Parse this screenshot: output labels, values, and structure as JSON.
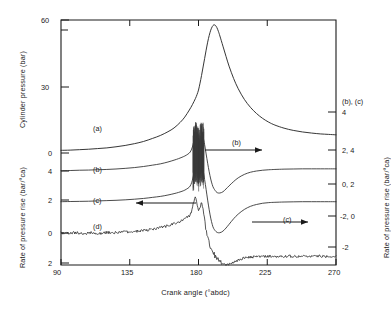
{
  "chart_data": {
    "type": "line",
    "title": "",
    "xlabel": "Crank angle (°abdc)",
    "ylabel_left_top": "Cylinder pressure (bar)",
    "ylabel_left_bottom": "Rate of pressure rise (bar/°ca)",
    "ylabel_right": "Rate of pressure rise (bar/°ca)",
    "right_axis_header": "(b), (c)",
    "xlim": [
      90,
      270
    ],
    "xticks": [
      90,
      135,
      180,
      225,
      270
    ],
    "xticklabels": [
      "90",
      "135",
      "180",
      "225",
      "270"
    ],
    "left_axis_upper_ticklabels": [
      "60",
      "30",
      "0"
    ],
    "left_axis_lower_ticklabels": [
      "4",
      "2",
      "0",
      "2"
    ],
    "right_axis_ticklabels": [
      "4",
      "2,  4",
      "0,  2",
      "-2,  0",
      "-2"
    ],
    "grid": false,
    "legend_position": "inline-annotations",
    "annotations": [
      {
        "text": "(a)",
        "x": 124,
        "y": 0
      },
      {
        "text": "(b)",
        "x": 110,
        "y": 0
      },
      {
        "text": "(c)",
        "x": 110,
        "y": 0
      },
      {
        "text": "(d)",
        "x": 112,
        "y": 0
      },
      {
        "text": "(b)",
        "x": 196,
        "y": 0
      },
      {
        "text": "(c)",
        "x": 223,
        "y": 0
      }
    ],
    "arrows": [
      {
        "name": "arrow-b-right",
        "direction": "right"
      },
      {
        "name": "arrow-c-right",
        "direction": "right"
      },
      {
        "name": "arrow-d-left",
        "direction": "left"
      }
    ],
    "series": [
      {
        "name": "(a)",
        "label": "(a)",
        "axis": "left-upper",
        "description": "Cylinder pressure trace, rises to peak near 190 deg abdc",
        "x": [
          90,
          96,
          102,
          108,
          114,
          120,
          126,
          132,
          138,
          144,
          150,
          155,
          160,
          164,
          168,
          171,
          174,
          176,
          178,
          179,
          180,
          181,
          182,
          183,
          184,
          185,
          186,
          187,
          188,
          189,
          190,
          191,
          192,
          193,
          194,
          196,
          198,
          200,
          203,
          206,
          210,
          214,
          218,
          222,
          226,
          230,
          236,
          242,
          248,
          254,
          260,
          265,
          270
        ],
        "y": [
          1.2,
          1.3,
          1.5,
          1.7,
          2.0,
          2.3,
          2.8,
          3.4,
          4.2,
          5.2,
          6.6,
          7.9,
          9.6,
          11.3,
          13.8,
          16.2,
          19.4,
          21.8,
          24.6,
          26.3,
          28.4,
          31.5,
          35.0,
          38.8,
          42.6,
          46.4,
          50.0,
          53.0,
          55.4,
          57.0,
          57.8,
          57.6,
          56.6,
          54.9,
          52.8,
          48.2,
          43.6,
          39.2,
          33.6,
          29.0,
          24.2,
          20.6,
          17.8,
          15.6,
          13.9,
          12.6,
          11.2,
          10.2,
          9.5,
          9.0,
          8.6,
          8.4,
          8.2
        ]
      },
      {
        "name": "(b)",
        "label": "(b)",
        "axis": "right",
        "description": "Rate of pressure rise trace b, offset baseline near 4 on left-lower scale, sharp spike at 180 deg",
        "x": [
          90,
          96,
          102,
          108,
          114,
          120,
          126,
          132,
          138,
          144,
          150,
          155,
          160,
          164,
          167,
          170,
          172,
          174,
          175,
          176,
          177,
          178,
          179,
          180,
          181,
          182,
          183,
          184,
          185,
          186,
          187,
          188,
          189,
          190,
          192,
          194,
          196,
          198,
          200,
          203,
          206,
          210,
          214,
          218,
          222,
          226,
          230,
          236,
          242,
          248,
          254,
          260,
          265,
          270
        ],
        "y": [
          4.02,
          4.03,
          4.05,
          4.06,
          4.08,
          4.1,
          4.13,
          4.17,
          4.22,
          4.29,
          4.38,
          4.46,
          4.58,
          4.7,
          4.8,
          4.92,
          5.02,
          5.16,
          5.3,
          5.55,
          5.92,
          6.25,
          6.05,
          5.72,
          5.95,
          6.35,
          6.18,
          5.7,
          5.1,
          4.5,
          3.95,
          3.48,
          3.12,
          2.88,
          2.62,
          2.58,
          2.66,
          2.84,
          3.04,
          3.32,
          3.56,
          3.78,
          3.92,
          4.0,
          4.05,
          4.08,
          4.1,
          4.12,
          4.13,
          4.14,
          4.14,
          4.14,
          4.14,
          4.14
        ]
      },
      {
        "name": "(c)",
        "label": "(c)",
        "axis": "right",
        "description": "Rate of pressure rise trace c, offset baseline near 2 on left-lower scale, sharp spike at 180 deg",
        "x": [
          90,
          96,
          102,
          108,
          114,
          120,
          126,
          132,
          138,
          144,
          150,
          155,
          160,
          164,
          167,
          170,
          172,
          174,
          175,
          176,
          177,
          178,
          179,
          180,
          181,
          182,
          183,
          184,
          185,
          186,
          187,
          188,
          189,
          190,
          192,
          194,
          196,
          198,
          200,
          203,
          206,
          210,
          214,
          218,
          222,
          226,
          230,
          236,
          242,
          248,
          254,
          260,
          265,
          270
        ],
        "y": [
          2.02,
          2.03,
          2.04,
          2.05,
          2.07,
          2.09,
          2.11,
          2.14,
          2.18,
          2.23,
          2.3,
          2.36,
          2.45,
          2.54,
          2.62,
          2.72,
          2.82,
          2.96,
          3.12,
          3.4,
          3.86,
          4.3,
          4.05,
          3.62,
          3.88,
          4.3,
          4.05,
          3.45,
          2.8,
          2.12,
          1.5,
          0.96,
          0.55,
          0.28,
          0.05,
          0.02,
          0.12,
          0.32,
          0.56,
          0.92,
          1.22,
          1.52,
          1.72,
          1.84,
          1.92,
          1.96,
          1.98,
          2.0,
          2.01,
          2.02,
          2.02,
          2.02,
          2.02,
          2.02
        ]
      },
      {
        "name": "(d)",
        "label": "(d)",
        "axis": "left-lower",
        "description": "Noisy rate of pressure rise trace d, baseline near 0, large spike then deep trough near 200 deg",
        "x": [
          90,
          95,
          100,
          105,
          110,
          115,
          120,
          125,
          130,
          135,
          140,
          145,
          150,
          154,
          158,
          162,
          165,
          168,
          170,
          172,
          174,
          175,
          176,
          177,
          178,
          179,
          180,
          181,
          182,
          183,
          184,
          185,
          186,
          188,
          190,
          192,
          194,
          196,
          198,
          200,
          202,
          205,
          208,
          212,
          216,
          220,
          225,
          230,
          236,
          242,
          248,
          254,
          260,
          265,
          270
        ],
        "y": [
          0.0,
          -0.02,
          0.03,
          -0.04,
          0.02,
          -0.03,
          0.04,
          0.02,
          0.06,
          0.05,
          0.12,
          0.16,
          0.24,
          0.32,
          0.42,
          0.52,
          0.62,
          0.74,
          0.84,
          0.96,
          1.12,
          1.28,
          1.56,
          2.0,
          2.3,
          1.82,
          1.4,
          1.62,
          1.98,
          1.45,
          0.82,
          0.2,
          -0.32,
          -0.92,
          -1.35,
          -1.66,
          -1.85,
          -1.96,
          -2.02,
          -2.0,
          -1.92,
          -1.78,
          -1.66,
          -1.58,
          -1.54,
          -1.52,
          -1.5,
          -1.5,
          -1.5,
          -1.5,
          -1.5,
          -1.5,
          -1.5,
          -1.5,
          -1.5
        ]
      }
    ]
  }
}
